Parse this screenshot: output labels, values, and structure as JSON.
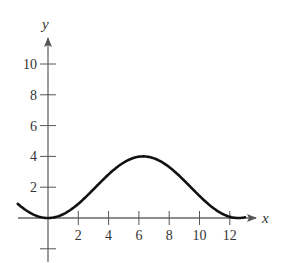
{
  "chart_data": {
    "type": "line",
    "title": "",
    "xlabel": "x",
    "ylabel": "y",
    "xlim": [
      -2,
      13
    ],
    "ylim": [
      -2,
      11.5
    ],
    "grid": false,
    "x_ticks": [
      2,
      4,
      6,
      8,
      10,
      12
    ],
    "y_ticks": [
      2,
      4,
      6,
      8,
      10
    ],
    "y_unlabeled_ticks": [
      -2
    ],
    "x_tick_labels": [
      "2",
      "4",
      "6",
      "8",
      "10",
      "12"
    ],
    "y_tick_labels": [
      "2",
      "4",
      "6",
      "8",
      "10"
    ],
    "series": [
      {
        "name": "curve",
        "description": "Cosine-shaped curve: minimum 0 at x=0, maximum 4 near x≈6.3, returns to 0 near x≈12.6",
        "x": [
          -2,
          -1,
          0,
          1,
          2,
          3,
          4,
          5,
          6,
          6.28,
          7,
          8,
          9,
          10,
          11,
          12,
          12.57,
          13
        ],
        "y": [
          0.92,
          0.24,
          0,
          0.24,
          0.92,
          1.86,
          2.83,
          3.6,
          3.98,
          4,
          3.87,
          3.31,
          2.42,
          1.43,
          0.59,
          0.08,
          0,
          0.05
        ]
      }
    ],
    "color": "#111111"
  },
  "labels": {
    "x_axis": "x",
    "y_axis": "y",
    "xt": [
      "2",
      "4",
      "6",
      "8",
      "10",
      "12"
    ],
    "yt": [
      "2",
      "4",
      "6",
      "8",
      "10"
    ]
  }
}
